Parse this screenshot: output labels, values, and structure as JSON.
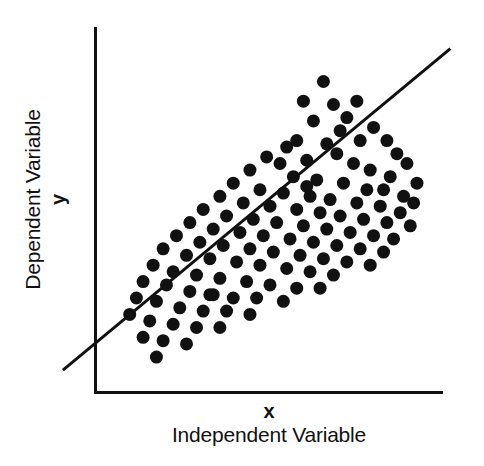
{
  "figure": {
    "background_color": "#ffffff",
    "ink_color": "#111111"
  },
  "axes": {
    "y_axis": {
      "label_main": "Dependent Variable",
      "label_symbol": "y"
    },
    "x_axis": {
      "label_main": "Independent Variable",
      "label_symbol": "x"
    }
  },
  "chart_data": {
    "type": "scatter",
    "title": "",
    "xlabel": "Independent Variable",
    "ylabel": "Dependent Variable",
    "xlabel_symbol": "x",
    "ylabel_symbol": "y",
    "grid": false,
    "legend": null,
    "xlim": [
      0,
      100
    ],
    "ylim": [
      0,
      100
    ],
    "axis_ticks": {
      "x": [],
      "y": []
    },
    "marker": {
      "shape": "circle",
      "color": "#111111",
      "diameter_px": 13
    },
    "trendline": {
      "label": "regression line",
      "color": "#111111",
      "width_px": 3,
      "x": [
        -12,
        104
      ],
      "y": [
        3,
        101
      ],
      "slope": 0.845,
      "intercept": 13.1,
      "extends_beyond_axes": true
    },
    "n_points": 115,
    "points": [
      [
        66,
        91
      ],
      [
        60,
        85
      ],
      [
        69,
        84
      ],
      [
        76,
        85
      ],
      [
        73,
        80
      ],
      [
        63,
        79
      ],
      [
        71,
        76
      ],
      [
        81,
        77
      ],
      [
        77,
        73
      ],
      [
        58,
        73
      ],
      [
        55,
        71
      ],
      [
        67,
        72
      ],
      [
        85,
        73
      ],
      [
        88,
        69
      ],
      [
        49,
        68
      ],
      [
        53,
        66
      ],
      [
        61,
        67
      ],
      [
        70,
        69
      ],
      [
        75,
        66
      ],
      [
        80,
        64
      ],
      [
        91,
        66
      ],
      [
        86,
        62
      ],
      [
        44,
        64
      ],
      [
        57,
        62
      ],
      [
        64,
        61
      ],
      [
        72,
        60
      ],
      [
        79,
        58
      ],
      [
        84,
        58
      ],
      [
        94,
        60
      ],
      [
        90,
        56
      ],
      [
        39,
        60
      ],
      [
        47,
        58
      ],
      [
        54,
        57
      ],
      [
        62,
        56
      ],
      [
        68,
        55
      ],
      [
        76,
        54
      ],
      [
        83,
        53
      ],
      [
        89,
        51
      ],
      [
        93,
        54
      ],
      [
        35,
        56
      ],
      [
        42,
        54
      ],
      [
        50,
        53
      ],
      [
        58,
        52
      ],
      [
        65,
        51
      ],
      [
        71,
        50
      ],
      [
        78,
        49
      ],
      [
        85,
        48
      ],
      [
        92,
        47
      ],
      [
        30,
        52
      ],
      [
        37,
        50
      ],
      [
        45,
        49
      ],
      [
        52,
        48
      ],
      [
        60,
        47
      ],
      [
        67,
        46
      ],
      [
        74,
        45
      ],
      [
        81,
        44
      ],
      [
        87,
        43
      ],
      [
        26,
        48
      ],
      [
        33,
        46
      ],
      [
        41,
        45
      ],
      [
        48,
        44
      ],
      [
        56,
        43
      ],
      [
        63,
        42
      ],
      [
        70,
        41
      ],
      [
        77,
        40
      ],
      [
        84,
        39
      ],
      [
        22,
        44
      ],
      [
        29,
        42
      ],
      [
        36,
        41
      ],
      [
        44,
        40
      ],
      [
        51,
        39
      ],
      [
        59,
        38
      ],
      [
        66,
        37
      ],
      [
        73,
        36
      ],
      [
        80,
        35
      ],
      [
        18,
        40
      ],
      [
        25,
        38
      ],
      [
        32,
        37
      ],
      [
        40,
        36
      ],
      [
        47,
        35
      ],
      [
        55,
        34
      ],
      [
        62,
        33
      ],
      [
        69,
        32
      ],
      [
        15,
        35
      ],
      [
        21,
        33
      ],
      [
        28,
        32
      ],
      [
        35,
        31
      ],
      [
        43,
        30
      ],
      [
        50,
        29
      ],
      [
        58,
        28
      ],
      [
        65,
        28
      ],
      [
        12,
        30
      ],
      [
        19,
        29
      ],
      [
        26,
        27
      ],
      [
        33,
        26
      ],
      [
        39,
        25
      ],
      [
        46,
        25
      ],
      [
        54,
        24
      ],
      [
        10,
        25
      ],
      [
        16,
        24
      ],
      [
        23,
        22
      ],
      [
        30,
        21
      ],
      [
        37,
        21
      ],
      [
        44,
        20
      ],
      [
        8,
        20
      ],
      [
        14,
        18
      ],
      [
        21,
        17
      ],
      [
        28,
        16
      ],
      [
        35,
        16
      ],
      [
        12,
        13
      ],
      [
        18,
        12
      ],
      [
        25,
        11
      ],
      [
        16,
        7
      ],
      [
        32,
        26
      ],
      [
        61,
        59
      ]
    ]
  }
}
